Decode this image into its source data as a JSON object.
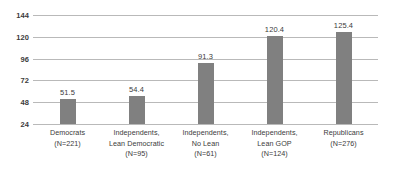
{
  "chart_data": {
    "type": "bar",
    "title": "",
    "subtitle": "",
    "xlabel": "",
    "ylabel": "",
    "ylim": [
      24,
      144
    ],
    "yticks": [
      24,
      48,
      72,
      96,
      120,
      144
    ],
    "grid": true,
    "legend": false,
    "bar_color": "#808080",
    "gridline_color": "#b9b9b9",
    "background_color": "#ffffff",
    "text_color": "#3b3b3b",
    "categories": [
      "Democrats (N=221)",
      "Independents, Lean Democratic (N=95)",
      "Independents, No Lean (N=61)",
      "Independents, Lean GOP (N=124)",
      "Republicans (N=276)"
    ],
    "category_lines": [
      [
        "Democrats",
        "(N=221)"
      ],
      [
        "Independents,",
        "Lean Democratic",
        "(N=95)"
      ],
      [
        "Independents,",
        "No Lean",
        "(N=61)"
      ],
      [
        "Independents,",
        "Lean GOP",
        "(N=124)"
      ],
      [
        "Republicans",
        "(N=276)"
      ]
    ],
    "sample_sizes": [
      221,
      95,
      61,
      124,
      276
    ],
    "values": [
      51.5,
      54.4,
      91.3,
      120.4,
      125.4
    ],
    "value_labels": [
      "51.5",
      "54.4",
      "91.3",
      "120.4",
      "125.4"
    ],
    "ytick_labels": [
      "144",
      "120",
      "96",
      "72",
      "48",
      "24"
    ]
  }
}
